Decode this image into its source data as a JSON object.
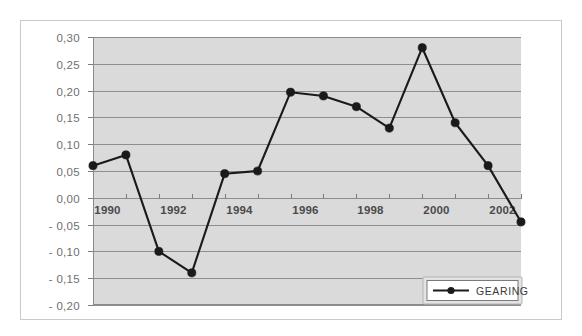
{
  "chart_data": {
    "type": "line",
    "title": "",
    "xlabel": "",
    "ylabel": "",
    "x": [
      1990,
      1991,
      1992,
      1993,
      1994,
      1995,
      1996,
      1997,
      1998,
      1999,
      2000,
      2001,
      2002,
      2003
    ],
    "series": [
      {
        "name": "GEARING",
        "values": [
          0.06,
          0.08,
          -0.1,
          -0.14,
          0.045,
          0.05,
          0.197,
          0.19,
          0.17,
          0.13,
          0.28,
          0.14,
          0.06,
          -0.045
        ],
        "color": "#1a1a1a",
        "marker": "filled-circle"
      }
    ],
    "ylim": [
      -0.2,
      0.3
    ],
    "ytick_values": [
      0.3,
      0.25,
      0.2,
      0.15,
      0.1,
      0.05,
      0.0,
      -0.05,
      -0.1,
      -0.15,
      -0.2
    ],
    "ytick_labels": [
      "0,30",
      "0,25",
      "0,20",
      "0,15",
      "0,10",
      "0,05",
      "0,00",
      "- 0,05",
      "- 0,10",
      "- 0,15",
      "- 0,20"
    ],
    "xlim": [
      1990,
      2003
    ],
    "xtick_values": [
      1990,
      1991,
      1992,
      1993,
      1994,
      1995,
      1996,
      1997,
      1998,
      1999,
      2000,
      2001,
      2002,
      2003
    ],
    "xtick_labels": [
      "1990",
      "",
      "1992",
      "",
      "1994",
      "",
      "1996",
      "",
      "1998",
      "",
      "2000",
      "",
      "2002",
      ""
    ],
    "grid": true,
    "grid_orientation": "horizontal",
    "legend": {
      "entries": [
        "GEARING"
      ],
      "position": "bottom-right"
    },
    "plot_background": "#dadada",
    "gridline_color": "#8e8e8e",
    "page_background": "#ffffff",
    "border_color": "#c9c9c9"
  }
}
